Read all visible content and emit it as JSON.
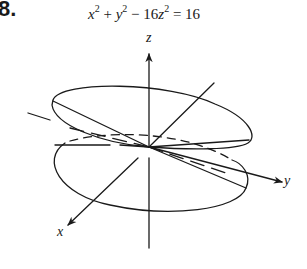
{
  "figure": {
    "problem_number": "8.",
    "equation": {
      "x_var": "x",
      "y_var": "y",
      "z_var": "z",
      "exp": "2",
      "plus": " + ",
      "minus": " − ",
      "coef": "16",
      "equals": " = ",
      "rhs": "16"
    },
    "axes": {
      "x_label": "x",
      "y_label": "y",
      "z_label": "z"
    },
    "colors": {
      "stroke": "#1a1a1a",
      "background": "#ffffff"
    }
  }
}
